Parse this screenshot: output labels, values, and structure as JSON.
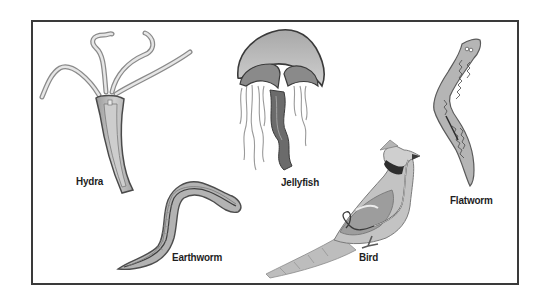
{
  "diagram": {
    "animals": [
      {
        "id": "hydra",
        "label": "Hydra"
      },
      {
        "id": "earthworm",
        "label": "Earthworm"
      },
      {
        "id": "jellyfish",
        "label": "Jellyfish"
      },
      {
        "id": "bird",
        "label": "Bird"
      },
      {
        "id": "flatworm",
        "label": "Flatworm"
      }
    ],
    "colors": {
      "frame": "#3a3a3a",
      "body_fill": "#b9b9b9",
      "body_light": "#d9d9d9",
      "outline": "#5a5a5a",
      "dark": "#3c3c3c",
      "label": "#1e1e1e"
    }
  }
}
